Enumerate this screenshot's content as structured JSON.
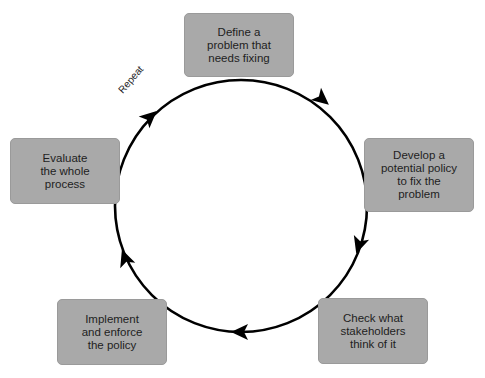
{
  "diagram": {
    "type": "cycle",
    "direction": "clockwise",
    "colors": {
      "box_fill": "#a9a9a9",
      "text": "#1e1e1e",
      "arrow": "#000000",
      "background": "#ffffff"
    },
    "loop_label": "Repeat",
    "steps": [
      {
        "id": "define",
        "label": "Define a\nproblem that\nneeds fixing"
      },
      {
        "id": "develop",
        "label": "Develop a\npotential policy\nto fix the\nproblem"
      },
      {
        "id": "check",
        "label": "Check what\nstakeholders\nthink of it"
      },
      {
        "id": "implement",
        "label": "Implement\nand enforce\nthe policy"
      },
      {
        "id": "evaluate",
        "label": "Evaluate\nthe whole\nprocess"
      }
    ]
  }
}
